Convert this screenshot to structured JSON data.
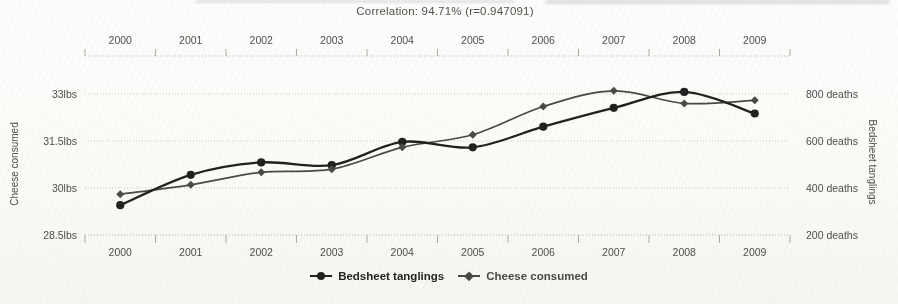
{
  "title": "Correlation: 94.71% (r=0.947091)",
  "chart_data": {
    "type": "line",
    "x": [
      "2000",
      "2001",
      "2002",
      "2003",
      "2004",
      "2005",
      "2006",
      "2007",
      "2008",
      "2009"
    ],
    "series": [
      {
        "name": "Bedsheet tanglings",
        "axis": "right",
        "marker": "circle",
        "color": "#1e1e1c",
        "line_width": 2.3,
        "values": [
          327,
          456,
          509,
          497,
          596,
          573,
          661,
          741,
          809,
          717
        ]
      },
      {
        "name": "Cheese consumed",
        "axis": "left",
        "marker": "diamond",
        "color": "#474745",
        "line_width": 1.7,
        "values": [
          29.8,
          30.1,
          30.5,
          30.6,
          31.3,
          31.7,
          32.6,
          33.1,
          32.7,
          32.8
        ]
      }
    ],
    "left_axis": {
      "label": "Cheese consumed",
      "tick_labels": [
        "33lbs",
        "31.5lbs",
        "30lbs",
        "28.5lbs"
      ],
      "tick_values": [
        33,
        31.5,
        30,
        28.5
      ],
      "min": 28.5,
      "max": 33
    },
    "right_axis": {
      "label": "Bedsheet tanglings",
      "tick_labels": [
        "800 deaths",
        "600 deaths",
        "400 deaths",
        "200 deaths"
      ],
      "tick_values": [
        800,
        600,
        400,
        200
      ],
      "min": 200,
      "max": 800
    },
    "x_axis": {
      "labels_top": true,
      "labels_bottom": true
    },
    "grid": "horizontal dotted",
    "legend_position": "bottom center",
    "curve": "smooth"
  },
  "colors": {
    "grid": "#c7c7c3",
    "axis": "#b3b3af",
    "tick": "#a9a9a5",
    "text": "#4c4c4a",
    "paper": "#fbfbf8"
  }
}
